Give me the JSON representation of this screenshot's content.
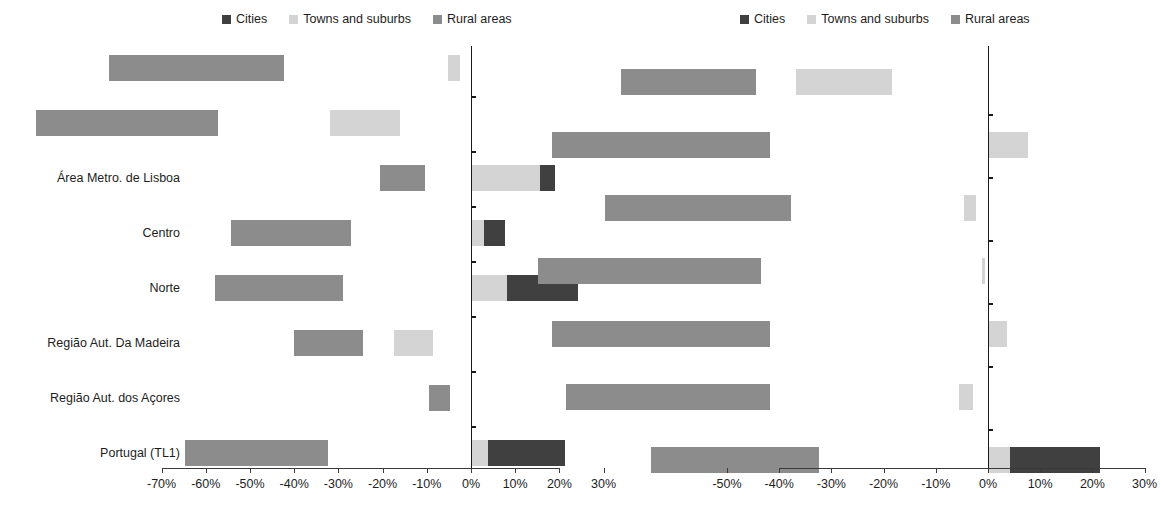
{
  "colors": {
    "cities": "#404040",
    "towns": "#d4d4d4",
    "rural": "#8c8c8c",
    "axis": "#1a1a1a",
    "text": "#1d1d1d"
  },
  "legend": {
    "entries": [
      {
        "label": "Cities",
        "key": "cities"
      },
      {
        "label": "Towns and suburbs",
        "key": "towns"
      },
      {
        "label": "Rural areas",
        "key": "rural"
      }
    ]
  },
  "chart_data": [
    {
      "type": "bar",
      "orientation": "horizontal",
      "stacked": true,
      "diverging": true,
      "panel": "left",
      "title": "",
      "xlabel": "",
      "ylabel": "",
      "xlim": [
        -70,
        30
      ],
      "xticks": [
        -70,
        -60,
        -50,
        -40,
        -30,
        -20,
        -10,
        0,
        10,
        20,
        30
      ],
      "xtick_labels": [
        "-70%",
        "-60%",
        "-50%",
        "-40%",
        "-30%",
        "-20%",
        "-10%",
        "0%",
        "10%",
        "20%",
        "30%"
      ],
      "grid": false,
      "legend_position": "top",
      "categories": [
        "Alentejo",
        "Algarve",
        "Área Metro. de Lisboa",
        "Centro",
        "Norte",
        "Região Aut. Da Madeira",
        "Região Aut. dos Açores",
        "Portugal (TL1)"
      ],
      "series": [
        {
          "name": "Rural areas",
          "key": "rural",
          "values": [
            -39.6,
            -41.2,
            -10.3,
            -27.1,
            -29.0,
            -15.7,
            -4.7,
            -32.4
          ]
        },
        {
          "name": "Towns and suburbs",
          "key": "towns",
          "values": [
            -2.6,
            -16.0,
            15.7,
            2.9,
            8.1,
            -8.7,
            0.0,
            3.9
          ]
        },
        {
          "name": "Cities",
          "key": "cities",
          "values": [
            0.0,
            0.0,
            3.4,
            4.9,
            16.2,
            0.0,
            0.0,
            17.3
          ]
        }
      ],
      "stack_starts": {
        "rural": [
          -42.2,
          -57.2,
          -10.3,
          -27.1,
          -29.0,
          -24.4,
          -4.7,
          -32.4
        ],
        "towns": [
          -2.6,
          -16.0,
          0.0,
          0.0,
          0.0,
          -8.7,
          0.0,
          0.0
        ],
        "cities": [
          0.0,
          0.0,
          15.7,
          2.9,
          8.1,
          0.0,
          0.0,
          3.9
        ]
      }
    },
    {
      "type": "bar",
      "orientation": "horizontal",
      "stacked": true,
      "diverging": true,
      "panel": "right",
      "title": "",
      "xlabel": "",
      "ylabel": "",
      "xlim": [
        -50,
        30
      ],
      "xticks": [
        -50,
        -40,
        -30,
        -20,
        -10,
        0,
        10,
        20,
        30
      ],
      "xtick_labels": [
        "-50%",
        "-40%",
        "-30%",
        "-20%",
        "-10%",
        "0%",
        "10%",
        "20%",
        "30%"
      ],
      "grid": false,
      "legend_position": "top",
      "categories": [
        "Alentejo Central",
        "Alentejo Litoral",
        "Alto Alentejo",
        "Baixo Alentejo",
        "Lezíria do Tejo",
        "Alentejo (TL2)",
        "Portugal (TL1)"
      ],
      "series": [
        {
          "name": "Rural areas",
          "key": "rural",
          "values": [
            -26.0,
            -41.8,
            -35.5,
            -42.8,
            -41.8,
            -39.0,
            -32.3
          ]
        },
        {
          "name": "Towns and suburbs",
          "key": "towns",
          "values": [
            -18.4,
            7.7,
            -2.3,
            -0.6,
            3.6,
            -2.8,
            4.2
          ]
        },
        {
          "name": "Cities",
          "key": "cities",
          "values": [
            0.0,
            0.0,
            0.0,
            0.0,
            0.0,
            0.0,
            17.3
          ]
        }
      ],
      "stack_starts": {
        "rural": [
          -44.4,
          -41.8,
          -37.8,
          -43.4,
          -41.8,
          -41.8,
          -32.3
        ],
        "towns": [
          -18.4,
          0.0,
          -2.3,
          -0.6,
          0.0,
          -2.8,
          0.0
        ],
        "cities": [
          0.0,
          0.0,
          0.0,
          0.0,
          0.0,
          0.0,
          4.2
        ]
      }
    }
  ]
}
